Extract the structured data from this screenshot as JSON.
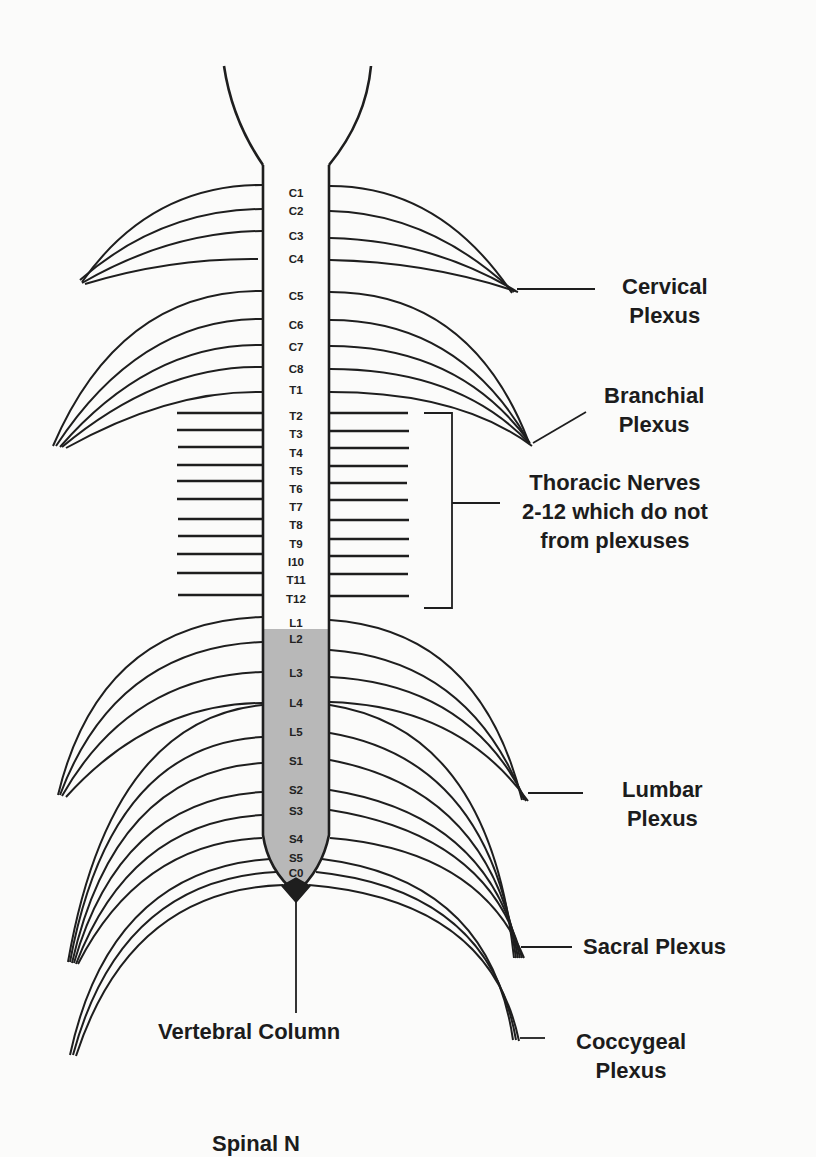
{
  "diagram": {
    "colors": {
      "ink": "#1e1e1e",
      "background": "#fbfbfa",
      "cord_fill_lower": "#b8b8b8"
    },
    "segments": [
      {
        "label": "C1",
        "y": 193
      },
      {
        "label": "C2",
        "y": 211
      },
      {
        "label": "C3",
        "y": 236
      },
      {
        "label": "C4",
        "y": 259
      },
      {
        "label": "C5",
        "y": 296
      },
      {
        "label": "C6",
        "y": 325
      },
      {
        "label": "C7",
        "y": 347
      },
      {
        "label": "C8",
        "y": 369
      },
      {
        "label": "T1",
        "y": 390
      },
      {
        "label": "T2",
        "y": 416
      },
      {
        "label": "T3",
        "y": 434
      },
      {
        "label": "T4",
        "y": 453
      },
      {
        "label": "T5",
        "y": 471
      },
      {
        "label": "T6",
        "y": 489
      },
      {
        "label": "T7",
        "y": 507
      },
      {
        "label": "T8",
        "y": 525
      },
      {
        "label": "T9",
        "y": 544
      },
      {
        "label": "I10",
        "y": 562
      },
      {
        "label": "T11",
        "y": 580
      },
      {
        "label": "T12",
        "y": 599
      },
      {
        "label": "L1",
        "y": 623
      },
      {
        "label": "L2",
        "y": 639
      },
      {
        "label": "L3",
        "y": 673
      },
      {
        "label": "L4",
        "y": 703
      },
      {
        "label": "L5",
        "y": 732
      },
      {
        "label": "S1",
        "y": 761
      },
      {
        "label": "S2",
        "y": 790
      },
      {
        "label": "S3",
        "y": 811
      },
      {
        "label": "S4",
        "y": 839
      },
      {
        "label": "S5",
        "y": 858
      },
      {
        "label": "C0",
        "y": 873
      }
    ]
  },
  "labels": {
    "cervical": [
      "Cervical",
      "Plexus"
    ],
    "branchial": [
      "Branchial",
      "Plexus"
    ],
    "thoracic": [
      "Thoracic Nerves",
      "2-12 which do not",
      "from plexuses"
    ],
    "lumbar": [
      "Lumbar",
      "Plexus"
    ],
    "sacral": [
      "Sacral Plexus"
    ],
    "coccygeal": [
      "Coccygeal",
      "Plexus"
    ],
    "vertebral": "Vertebral Column",
    "caption_partial": "Spinal N"
  }
}
